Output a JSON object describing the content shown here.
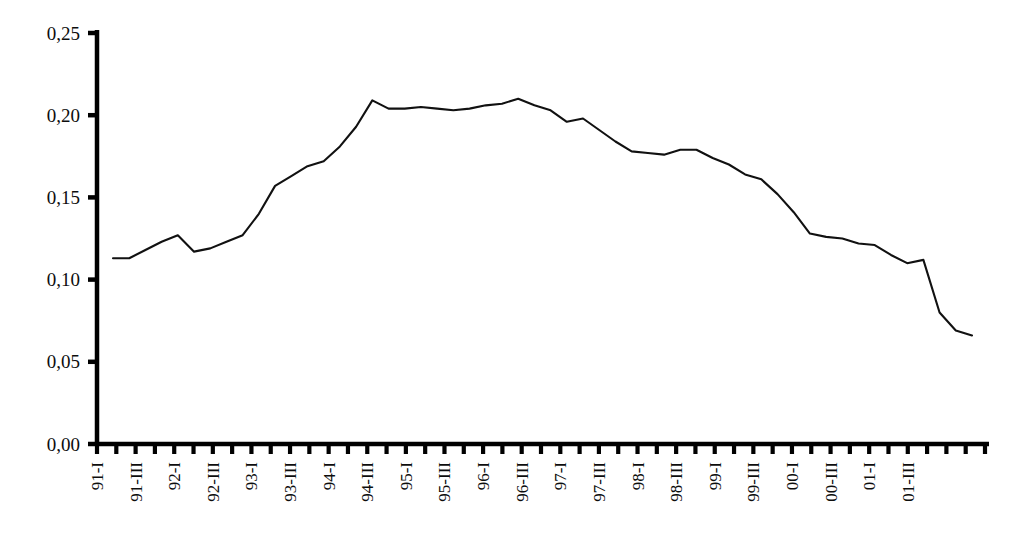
{
  "chart_data": {
    "type": "line",
    "title": "",
    "subtitle": "",
    "xlabel": "",
    "ylabel": "",
    "ylim": [
      0.0,
      0.25
    ],
    "ytick_values": [
      0.0,
      0.05,
      0.1,
      0.15,
      0.2,
      0.25
    ],
    "ytick_labels": [
      "0,00",
      "0,05",
      "0,10",
      "0,15",
      "0,20",
      "0,25"
    ],
    "decimal_separator": ",",
    "grid": false,
    "legend": null,
    "legend_position": "none",
    "line_color": "#111111",
    "axis_color": "#000000",
    "background_color": "#ffffff",
    "x_tick_count": 47,
    "x_labels_every": 2,
    "x_label_rotation": -90,
    "xtick_labels": [
      "91-I",
      "",
      "91-III",
      "",
      "92-I",
      "",
      "92-III",
      "",
      "93-I",
      "",
      "93-III",
      "",
      "94-I",
      "",
      "94-III",
      "",
      "95-I",
      "",
      "95-III",
      "",
      "96-I",
      "",
      "96-III",
      "",
      "97-I",
      "",
      "97-III",
      "",
      "98-I",
      "",
      "98-III",
      "",
      "99-I",
      "",
      "99-III",
      "",
      "00-I",
      "",
      "00-III",
      "",
      "01-I",
      "",
      "01-III",
      "",
      "",
      "",
      ""
    ],
    "visible_xtick_labels": [
      "91-I",
      "91-III",
      "92-I",
      "92-III",
      "93-I",
      "93-III",
      "94-I",
      "94-III",
      "95-I",
      "95-III",
      "96-I",
      "96-III",
      "97-I",
      "97-III",
      "98-I",
      "98-III",
      "99-I",
      "99-III",
      "00-I",
      "00-III",
      "01-I",
      "01-III"
    ],
    "x": [
      "91-I",
      "91-II",
      "91-III",
      "91-IV",
      "92-I",
      "92-II",
      "92-III",
      "92-IV",
      "93-I",
      "93-II",
      "93-III",
      "93-IV",
      "94-I",
      "94-II",
      "94-III",
      "94-IV",
      "95-I",
      "95-II",
      "95-III",
      "95-IV",
      "96-I",
      "96-II",
      "96-III",
      "96-IV",
      "97-I",
      "97-II",
      "97-III",
      "97-IV",
      "98-I",
      "98-II",
      "98-III",
      "98-IV",
      "99-I",
      "99-II",
      "99-III",
      "99-IV",
      "00-I",
      "00-II",
      "00-III",
      "00-IV",
      "01-I",
      "01-II",
      "01-III",
      "01-IV",
      "02-I",
      "02-II",
      "02-III"
    ],
    "values": [
      0.113,
      0.113,
      0.118,
      0.123,
      0.127,
      0.117,
      0.119,
      0.123,
      0.127,
      0.14,
      0.157,
      0.163,
      0.169,
      0.172,
      0.181,
      0.193,
      0.209,
      0.204,
      0.204,
      0.205,
      0.204,
      0.203,
      0.204,
      0.206,
      0.207,
      0.21,
      0.206,
      0.203,
      0.196,
      0.198,
      0.191,
      0.184,
      0.178,
      0.177,
      0.176,
      0.179,
      0.179,
      0.174,
      0.17,
      0.164,
      0.161,
      0.152,
      0.141,
      0.128,
      0.126,
      0.125,
      0.122
    ],
    "series": [
      {
        "name": "series-1",
        "values": [
          0.113,
          0.113,
          0.118,
          0.123,
          0.127,
          0.117,
          0.119,
          0.123,
          0.127,
          0.14,
          0.157,
          0.163,
          0.169,
          0.172,
          0.181,
          0.193,
          0.209,
          0.204,
          0.204,
          0.205,
          0.204,
          0.203,
          0.204,
          0.206,
          0.207,
          0.21,
          0.206,
          0.203,
          0.196,
          0.198,
          0.191,
          0.184,
          0.178,
          0.177,
          0.176,
          0.179,
          0.179,
          0.174,
          0.17,
          0.164,
          0.161,
          0.152,
          0.141,
          0.128,
          0.126,
          0.125,
          0.122
        ]
      }
    ],
    "tail_values_extra": [
      0.121,
      0.115,
      0.11,
      0.112,
      0.08,
      0.069,
      0.066
    ]
  }
}
